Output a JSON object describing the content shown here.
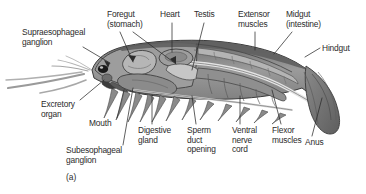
{
  "figure": {
    "panel_tag": "(a)",
    "background_color": "#ffffff",
    "ink_color": "#2b2b2b",
    "palette": {
      "outline": "#3a3a3a",
      "carapace_dark": "#6e6e6e",
      "carapace_mid": "#8f8f8f",
      "carapace_light": "#b8b8b8",
      "muscle_dark": "#777777",
      "muscle_mid": "#9a9a9a",
      "muscle_light": "#c4c4c4",
      "gut_light": "#d8d8d8",
      "eye_black": "#1a1a1a",
      "appendage_gray": "#8a8a8a",
      "tailfan_gray": "#7c7c7c"
    },
    "labels": [
      {
        "id": "supraesophageal-ganglion",
        "text": "Supraesophageal\nganglion",
        "x": 22,
        "y": 28,
        "align": "left",
        "leader": {
          "x1": 83,
          "y1": 47,
          "x2": 110,
          "y2": 63
        }
      },
      {
        "id": "foregut-stomach",
        "text": "Foregut\n(stomach)",
        "x": 107,
        "y": 10,
        "align": "left",
        "leader": {
          "x1": 120,
          "y1": 32,
          "x2": 133,
          "y2": 62
        }
      },
      {
        "id": "foregut-stomach-second-leader",
        "text": "",
        "x": 0,
        "y": 0,
        "align": "left",
        "leader": {
          "x1": 133,
          "y1": 32,
          "x2": 176,
          "y2": 64
        }
      },
      {
        "id": "heart",
        "text": "Heart",
        "x": 160,
        "y": 10,
        "align": "left",
        "leader": {
          "x1": 172,
          "y1": 23,
          "x2": 172,
          "y2": 52
        }
      },
      {
        "id": "testis",
        "text": "Testis",
        "x": 194,
        "y": 10,
        "align": "left",
        "leader": {
          "x1": 204,
          "y1": 23,
          "x2": 192,
          "y2": 70
        }
      },
      {
        "id": "extensor-muscles",
        "text": "Extensor\nmuscles",
        "x": 238,
        "y": 10,
        "align": "left",
        "leader": {
          "x1": 255,
          "y1": 32,
          "x2": 255,
          "y2": 50
        }
      },
      {
        "id": "midgut-intestine",
        "text": "Midgut\n(intestine)",
        "x": 286,
        "y": 10,
        "align": "left",
        "leader": {
          "x1": 292,
          "y1": 32,
          "x2": 274,
          "y2": 54
        }
      },
      {
        "id": "hindgut",
        "text": "Hindgut",
        "x": 322,
        "y": 44,
        "align": "left",
        "leader": {
          "x1": 320,
          "y1": 48,
          "x2": 305,
          "y2": 57
        }
      },
      {
        "id": "excretory-organ",
        "text": "Excretory\norgan",
        "x": 41,
        "y": 100,
        "align": "left",
        "leader": {
          "x1": 80,
          "y1": 100,
          "x2": 104,
          "y2": 80
        }
      },
      {
        "id": "mouth",
        "text": "Mouth",
        "x": 89,
        "y": 119,
        "align": "left",
        "leader": {
          "x1": 117,
          "y1": 118,
          "x2": 124,
          "y2": 90
        }
      },
      {
        "id": "subesophageal-ganglion",
        "text": "Subesophageal\nganglion",
        "x": 66,
        "y": 146,
        "align": "left",
        "leader": {
          "x1": 123,
          "y1": 145,
          "x2": 133,
          "y2": 88
        }
      },
      {
        "id": "digestive-gland",
        "text": "Digestive\ngland",
        "x": 138,
        "y": 126,
        "align": "left",
        "leader": {
          "x1": 152,
          "y1": 124,
          "x2": 152,
          "y2": 95
        }
      },
      {
        "id": "sperm-duct-opening",
        "text": "Sperm\nduct\nopening",
        "x": 187,
        "y": 126,
        "align": "left",
        "leader": {
          "x1": 196,
          "y1": 124,
          "x2": 192,
          "y2": 96
        }
      },
      {
        "id": "ventral-nerve-cord",
        "text": "Ventral\nnerve\ncord",
        "x": 232,
        "y": 126,
        "align": "left",
        "leader": {
          "x1": 240,
          "y1": 124,
          "x2": 240,
          "y2": 96
        }
      },
      {
        "id": "flexor-muscles",
        "text": "Flexor\nmuscles",
        "x": 272,
        "y": 126,
        "align": "left",
        "leader": {
          "x1": 281,
          "y1": 124,
          "x2": 272,
          "y2": 90
        }
      },
      {
        "id": "anus",
        "text": "Anus",
        "x": 305,
        "y": 138,
        "align": "left",
        "leader": {
          "x1": 312,
          "y1": 136,
          "x2": 322,
          "y2": 98
        }
      }
    ]
  }
}
